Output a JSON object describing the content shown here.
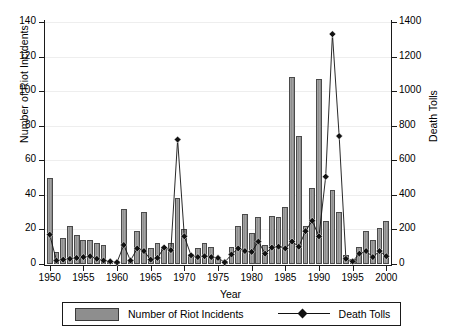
{
  "chart_data": {
    "type": "bar",
    "title": "",
    "xlabel": "Year",
    "ylabel": "Number of Riot Incidents",
    "ylabel_right": "Death Tolls",
    "xlim": [
      1949.3,
      2000.7
    ],
    "ylim": [
      0,
      140
    ],
    "ylim_right": [
      0,
      1400
    ],
    "yticks": [
      0,
      20,
      40,
      60,
      80,
      100,
      120,
      140
    ],
    "yticks_right": [
      0,
      200,
      400,
      600,
      800,
      1000,
      1200,
      1400
    ],
    "xticks": [
      1950,
      1955,
      1960,
      1965,
      1970,
      1975,
      1980,
      1985,
      1990,
      1995,
      2000
    ],
    "grid": true,
    "legend_position": "bottom",
    "x": [
      1950,
      1951,
      1952,
      1953,
      1954,
      1955,
      1956,
      1957,
      1958,
      1959,
      1960,
      1961,
      1962,
      1963,
      1964,
      1965,
      1966,
      1967,
      1968,
      1969,
      1970,
      1971,
      1972,
      1973,
      1974,
      1975,
      1976,
      1977,
      1978,
      1979,
      1980,
      1981,
      1982,
      1983,
      1984,
      1985,
      1986,
      1987,
      1988,
      1989,
      1990,
      1991,
      1992,
      1993,
      1994,
      1995,
      1996,
      1997,
      1998,
      1999,
      2000
    ],
    "series": [
      {
        "name": "Number of Riot Incidents",
        "axis": "left",
        "type": "bar",
        "color": "#8e8e8e",
        "values": [
          50,
          7,
          15,
          22,
          17,
          14,
          14,
          12,
          11,
          2,
          2,
          32,
          2,
          19,
          30,
          9,
          12,
          10,
          12,
          38,
          20,
          6,
          9,
          12,
          10,
          3,
          2,
          10,
          22,
          29,
          18,
          27,
          11,
          28,
          27,
          33,
          108,
          74,
          22,
          44,
          107,
          25,
          43,
          30,
          5,
          3,
          10,
          19,
          14,
          21,
          25
        ]
      },
      {
        "name": "Death Tolls",
        "axis": "right",
        "type": "line",
        "marker": "diamond",
        "color": "#111111",
        "values": [
          170,
          20,
          25,
          30,
          35,
          40,
          45,
          30,
          20,
          15,
          10,
          110,
          20,
          90,
          75,
          25,
          35,
          95,
          80,
          720,
          160,
          50,
          40,
          45,
          40,
          35,
          10,
          55,
          90,
          75,
          70,
          130,
          60,
          95,
          100,
          90,
          130,
          100,
          190,
          250,
          160,
          505,
          1330,
          740,
          30,
          15,
          60,
          75,
          40,
          75,
          45
        ]
      }
    ]
  },
  "legend": {
    "items": [
      {
        "label": "Number of Riot Incidents",
        "marker": "bar-swatch"
      },
      {
        "label": "Death Tolls",
        "marker": "diamond-line"
      }
    ]
  },
  "axes": {
    "left_title": "Number of Riot Incidents",
    "right_title": "Death Tolls",
    "bottom_title": "Year"
  }
}
